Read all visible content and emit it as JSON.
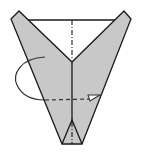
{
  "diagram": {
    "type": "origami-fold-step",
    "colors": {
      "paper": "#c8c8c8",
      "line": "#1a1a1a",
      "background": "#ffffff"
    },
    "elements": [
      {
        "name": "paper-shape",
        "description": "Grey V-shaped folded paper with two raised flaps"
      },
      {
        "name": "top-edge",
        "description": "Horizontal edge across the top opening"
      },
      {
        "name": "center-valley-fold-line",
        "description": "Vertical dash-dot line down the center"
      },
      {
        "name": "center-crease",
        "description": "Solid vertical crease line"
      },
      {
        "name": "bottom-triangle",
        "description": "Small triangular pocket at the bottom point"
      },
      {
        "name": "turn-over-arrow",
        "description": "Curved arrow looping behind indicating fold in half / turn over"
      }
    ]
  }
}
